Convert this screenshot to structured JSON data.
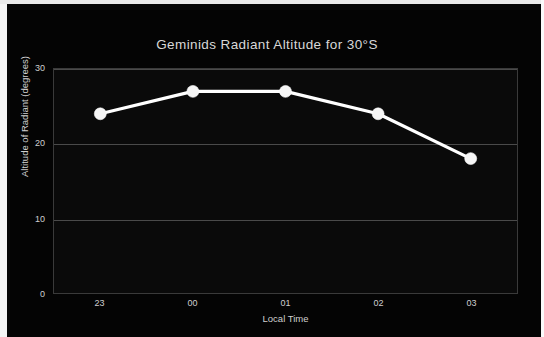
{
  "chart_data": {
    "type": "line",
    "title": "Geminids Radiant Altitude for 30°S",
    "xlabel": "Local Time",
    "ylabel": "Altitude of Radiant (degrees)",
    "categories": [
      "23",
      "00",
      "01",
      "02",
      "03"
    ],
    "values": [
      24,
      27,
      27,
      24,
      18
    ],
    "series": [
      {
        "name": "Radiant Altitude",
        "values": [
          24,
          27,
          27,
          24,
          18
        ]
      }
    ],
    "ylim": [
      0,
      30
    ],
    "yticks": [
      0,
      10,
      20,
      30
    ],
    "ytick_labels": [
      "0",
      "10",
      "20",
      "30"
    ],
    "xtick_labels": [
      "23",
      "00",
      "01",
      "02",
      "03"
    ],
    "grid": "horizontal",
    "legend": "none",
    "marker": "circle",
    "colors": {
      "background": "#040404",
      "plot_background": "#0a0a0a",
      "line": "#ffffff",
      "marker": "#f6f6f6",
      "gridline": "#4a4a4a",
      "axis_border": "#3a3a3a",
      "text": "#d8d8d8",
      "frame": "#f4f4f4"
    }
  }
}
